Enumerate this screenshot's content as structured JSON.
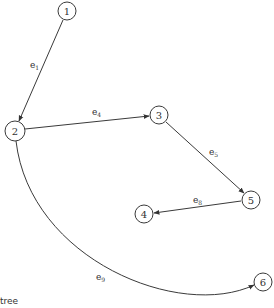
{
  "diagram": {
    "type": "directed-graph",
    "nodes": [
      {
        "id": "1",
        "label": "1",
        "x": 67,
        "y": 11
      },
      {
        "id": "2",
        "label": "2",
        "x": 15,
        "y": 131
      },
      {
        "id": "3",
        "label": "3",
        "x": 159,
        "y": 115
      },
      {
        "id": "4",
        "label": "4",
        "x": 144,
        "y": 214
      },
      {
        "id": "5",
        "label": "5",
        "x": 251,
        "y": 200
      },
      {
        "id": "6",
        "label": "6",
        "x": 263,
        "y": 282
      }
    ],
    "edges": [
      {
        "id": "e1",
        "from": "1",
        "to": "2",
        "label": "e",
        "sub": "1"
      },
      {
        "id": "e4",
        "from": "2",
        "to": "3",
        "label": "e",
        "sub": "4"
      },
      {
        "id": "e5",
        "from": "3",
        "to": "5",
        "label": "e",
        "sub": "5"
      },
      {
        "id": "e8",
        "from": "5",
        "to": "4",
        "label": "e",
        "sub": "8"
      },
      {
        "id": "e9",
        "from": "2",
        "to": "6",
        "label": "e",
        "sub": "9",
        "curved": true
      }
    ],
    "caption": "tree"
  }
}
